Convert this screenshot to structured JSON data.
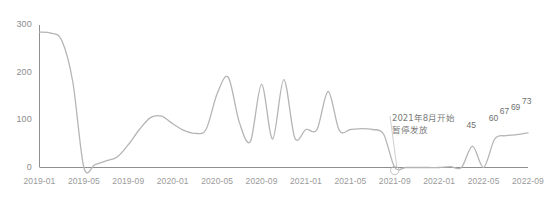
{
  "chart_data": {
    "type": "line",
    "title": "",
    "xlabel": "",
    "ylabel": "",
    "ylim": [
      0,
      300
    ],
    "yticks": [
      0,
      100,
      200,
      300
    ],
    "grid": false,
    "legend": "none",
    "line_color": "#b5b5b5",
    "axis_color": "#8f8f8f",
    "label_color": "#8c8c8c",
    "x": [
      "2019-01",
      "2019-02",
      "2019-03",
      "2019-04",
      "2019-05",
      "2019-06",
      "2019-07",
      "2019-08",
      "2019-09",
      "2019-10",
      "2019-11",
      "2019-12",
      "2020-01",
      "2020-02",
      "2020-03",
      "2020-04",
      "2020-05",
      "2020-06",
      "2020-07",
      "2020-08",
      "2020-09",
      "2020-10",
      "2020-11",
      "2020-12",
      "2021-01",
      "2021-02",
      "2021-03",
      "2021-04",
      "2021-05",
      "2021-06",
      "2021-07",
      "2021-08",
      "2021-09",
      "2021-10",
      "2021-11",
      "2021-12",
      "2022-01",
      "2022-02",
      "2022-03",
      "2022-04",
      "2022-05",
      "2022-06",
      "2022-07",
      "2022-08",
      "2022-09"
    ],
    "values": [
      285,
      283,
      268,
      180,
      0,
      6,
      14,
      22,
      48,
      80,
      105,
      108,
      92,
      78,
      72,
      80,
      155,
      190,
      95,
      55,
      175,
      60,
      185,
      62,
      80,
      80,
      160,
      78,
      80,
      82,
      80,
      70,
      0,
      0,
      0,
      0,
      0,
      2,
      0,
      45,
      0,
      60,
      67,
      69,
      73
    ],
    "xticks": [
      "2019-01",
      "2019-05",
      "2019-09",
      "2020-01",
      "2020-05",
      "2020-09",
      "2021-01",
      "2021-05",
      "2021-09",
      "2022-01",
      "2022-05",
      "2022-09"
    ],
    "point_labels": [
      {
        "x": "2022-04",
        "value": 45,
        "text": "45"
      },
      {
        "x": "2022-06",
        "value": 60,
        "text": "60"
      },
      {
        "x": "2022-07",
        "value": 67,
        "text": "67"
      },
      {
        "x": "2022-08",
        "value": 69,
        "text": "69"
      },
      {
        "x": "2022-09",
        "value": 73,
        "text": "73"
      }
    ],
    "annotations": [
      {
        "text": "2021年8月开始暂停发放",
        "target_x": "2021-09",
        "target_value": 0,
        "marker": "hollow-circle"
      }
    ]
  }
}
